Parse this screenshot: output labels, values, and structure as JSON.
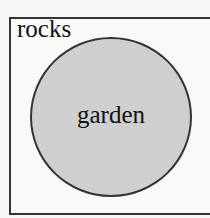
{
  "diagram": {
    "type": "venn",
    "outer_set": {
      "label": "rocks",
      "shape": "rectangle"
    },
    "inner_set": {
      "label": "garden",
      "shape": "circle",
      "fill": "#cfcfcf"
    },
    "stroke_color": "#333333"
  }
}
